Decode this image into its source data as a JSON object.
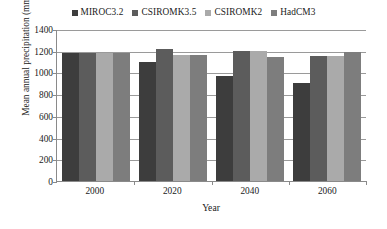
{
  "chart_data": {
    "type": "bar",
    "title": "",
    "xlabel": "Year",
    "ylabel": "Mean annual precipitation (mm)",
    "categories": [
      "2000",
      "2020",
      "2040",
      "2060"
    ],
    "ylim": [
      0,
      1400
    ],
    "yticks": [
      0,
      200,
      400,
      600,
      800,
      1000,
      1200,
      1400
    ],
    "ytick_labels": [
      "0",
      "200",
      "400",
      "600",
      "800",
      "1000",
      "1200",
      "1400"
    ],
    "grid": true,
    "legend_position": "top-center",
    "series": [
      {
        "name": "MIROC3.2",
        "color": "#3d3d3d",
        "values": [
          1180,
          1100,
          970,
          900
        ]
      },
      {
        "name": "CSIROMK3.5",
        "color": "#5c5c5c",
        "values": [
          1180,
          1215,
          1200,
          1155
        ]
      },
      {
        "name": "CSIROMK2",
        "color": "#aaaaaa",
        "values": [
          1180,
          1165,
          1200,
          1155
        ]
      },
      {
        "name": "HadCM3",
        "color": "#7d7d7d",
        "values": [
          1180,
          1165,
          1145,
          1190
        ]
      }
    ]
  },
  "axis": {
    "axis_color": "#8a8a8a",
    "grid_color": "#9a9a9a"
  }
}
